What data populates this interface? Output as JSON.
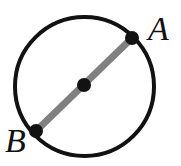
{
  "figure": {
    "background_color": "#ffffff",
    "width": 181,
    "height": 166
  },
  "labels": {
    "point_a": "A",
    "point_b": "B"
  },
  "chart_data": {
    "type": "diagram",
    "shape": "circle-with-diameter",
    "background_color": "#ffffff",
    "circle": {
      "name": "circle-outline",
      "center": [
        84.5,
        86.5
      ],
      "radius": 69.5,
      "stroke_color": "#121212",
      "stroke_width": 4,
      "fill": "none"
    },
    "chord": {
      "name": "diameter-AB",
      "from": [
        36,
        131
      ],
      "to": [
        132,
        38
      ],
      "stroke_color": "#808080",
      "stroke_width": 7,
      "is_diameter": true
    },
    "points": [
      {
        "label": "A",
        "x": 132,
        "y": 38,
        "radius": 7,
        "color": "#121212",
        "label_position": "upper-right"
      },
      {
        "label": "",
        "x": 84,
        "y": 85,
        "radius": 7,
        "color": "#121212",
        "label_position": "none",
        "role": "center"
      },
      {
        "label": "B",
        "x": 36,
        "y": 131,
        "radius": 7,
        "color": "#121212",
        "label_position": "lower-left"
      }
    ]
  }
}
